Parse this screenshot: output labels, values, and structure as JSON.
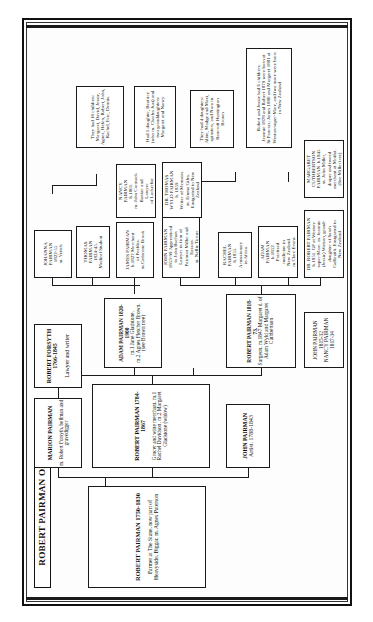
{
  "document": {
    "title": "ROBERT PAIRMAN OF BIGGAR",
    "orientation": "rotated-90-ccw"
  },
  "generations": {
    "g1": {
      "root": {
        "name": "ROBERT PAIRMAN 1750-1830",
        "detail": "Farmer at The Stane, now part of Heavyside, Biggar.  m. Agnes Paterson"
      }
    },
    "g2": {
      "marion": {
        "name": "MARION PAIRMAN",
        "detail": "m. Robert Forsyth, bellman and gravedigger"
      },
      "robert": {
        "name": "ROBERT PAIRMAN 1784-1867",
        "detail": "Grocer and wine merchant. m.1  Rachel Davidson.  m.2  Margaret Gladstone (widow)"
      },
      "john": {
        "name": "JOHN PAIRMAN",
        "detail": "Artist. 1788-1843"
      }
    },
    "g3": {
      "forsyth": {
        "name": "ROBERT FORSYTH 1766-1845",
        "detail": "Lawyer and writer"
      },
      "robert_surgeon": {
        "name": "ROBERT PAIRMAN 1818-73.",
        "detail": "Surgeon. m.1847 Margaret d. of Adam Wyld and Margaret Cuthbertson"
      },
      "adam": {
        "name": "ADAM PAIRMAN 1820-1900",
        "detail": "m.1 Jane Gladstone.\nm.2 Agnes Fletcher Brown.\n(see Brown tree)"
      },
      "john_nancy": {
        "name": "JOHN PAIRMAN\n1815-32\nNANCY PAIRMAN\n1817-34"
      }
    },
    "g4": {
      "johanna": {
        "text": "JOHANNA\nPAIRMAN\n1822-55\nm. Veitch"
      },
      "thomas": {
        "text": "THOMAS\nPAIRMAN\n1824-45.\nMedical Student"
      },
      "james": {
        "text": "JAMES PAIRMAN\nb.1827 Merchant\nof Peebles.\nm.Catherine Brook"
      },
      "john_b1853": {
        "text": "JOHN PAIRMAN\n1853-99 Apprenticed\nto John Buchan\nLawyer in firm of\nPairman Miller and\nEasson.\nm. Nellie Turner"
      },
      "rachel": {
        "text": "RACHEL\nPAIRMAN\nb.1855.\nA missionary\nin Africa."
      },
      "thomas_wyld": {
        "text": "DR. THOMAS\nWYLD PAIRMAN\nb. 1859\nWriter of Memoirs.\nm. Emma Giles.\nEmigrated to New\nZealand"
      },
      "nancy": {
        "text": "NANCY\nPAIRMAN\nb.1861.\nm. John Cormack\nBanker and\nLawyer\nof Lockerbie"
      },
      "adam_b1852": {
        "text": "ADAM\nPAIRMAN\nb.1852\nPractised\nmedicine in\nNew Zealand.\nm.Clare Evans"
      },
      "dr_robert": {
        "text": "DR. ROBERT PAIRMAN\nb.1851. GP at Weston-\nsuper-Mare. m. Jeannie\n(Jessie) Watson, grand-\ndaughter of Sarah\nGalbraith. Emigrated to\nNew Zealand."
      },
      "margaret": {
        "text": "MARGARET\nCUTHBERTSON\nPAIRMAN. b.1845\nm. John Miller,\ndraper and tweed\nmerchant at Moffat.\n(See Miller tree)"
      }
    },
    "g5": {
      "ten_children": {
        "text": "They had 10 children:\nMargaret, David, Jessie,\nAgnes, Helen, Robert, John,\nRachel, Eric, Dennis."
      },
      "one_daughter": {
        "text": "Had 1 daughter, Beatrice\n(who m. Charles Just) and\ntwo granddaughters:\nMargaret and Nancy"
      },
      "four_daughters": {
        "text": "They had 4 daughters:\nAline, Madge and Maxi,\nspinsters, and Nora m.\nBancroft Huntington\nBrown"
      },
      "six_children": {
        "text": "Robert and Jessie had 6 children:\nJeannie 1878 and Robert 1879 were born at\nSt Pancras; James 1880 and Margaret 1881 at\nWeston-super-Mare, and two more were born\nin New Zealand"
      }
    }
  }
}
